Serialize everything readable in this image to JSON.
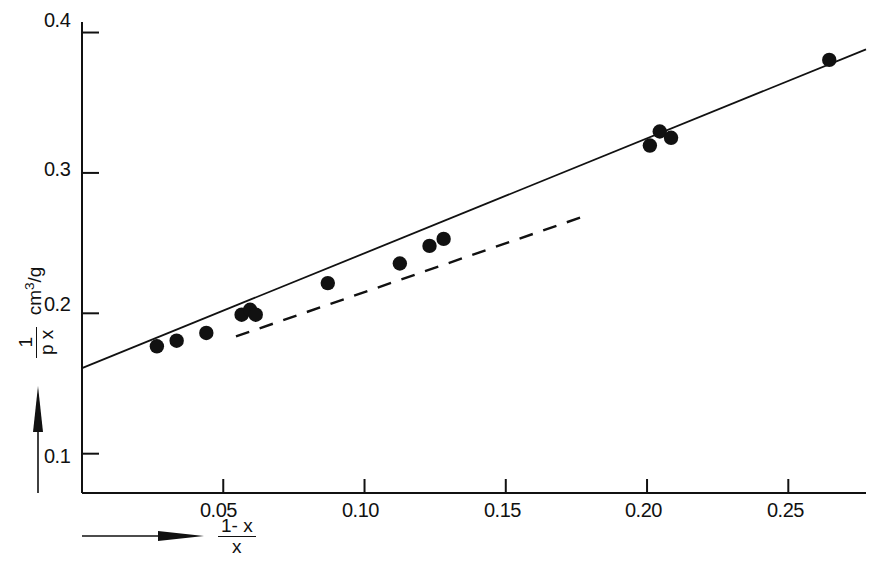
{
  "chart_data": {
    "type": "scatter",
    "title": "",
    "xlabel": "(1-x)/x",
    "ylabel": "1/(p x)  cm3/g",
    "xlim": [
      0.0,
      0.2775
    ],
    "ylim": [
      0.072,
      0.4075
    ],
    "grid": false,
    "legend": "none",
    "xticks": [
      0.05,
      0.1,
      0.15,
      0.2,
      0.25
    ],
    "xtick_labels": [
      "0.05",
      "0.10",
      "0.15",
      "0.20",
      "0.25"
    ],
    "yticks": [
      0.1,
      0.2,
      0.3,
      0.4
    ],
    "ytick_labels": [
      "0.1",
      "0.2",
      "0.3",
      "0.4"
    ],
    "points": [
      {
        "x": 0.0265,
        "y": 0.1765
      },
      {
        "x": 0.0335,
        "y": 0.1805
      },
      {
        "x": 0.044,
        "y": 0.186
      },
      {
        "x": 0.0565,
        "y": 0.199
      },
      {
        "x": 0.0595,
        "y": 0.2025
      },
      {
        "x": 0.0615,
        "y": 0.199
      },
      {
        "x": 0.087,
        "y": 0.2215
      },
      {
        "x": 0.1125,
        "y": 0.2355
      },
      {
        "x": 0.123,
        "y": 0.248
      },
      {
        "x": 0.128,
        "y": 0.253
      },
      {
        "x": 0.201,
        "y": 0.3195
      },
      {
        "x": 0.2045,
        "y": 0.3295
      },
      {
        "x": 0.2085,
        "y": 0.325
      },
      {
        "x": 0.2645,
        "y": 0.3805
      }
    ],
    "series": [
      {
        "name": "solid-fit-line",
        "style": "solid",
        "x": [
          0.0,
          0.2775
        ],
        "y": [
          0.161,
          0.388
        ]
      },
      {
        "name": "dashed-tangent-line",
        "style": "dashed",
        "x": [
          0.0545,
          0.179
        ],
        "y": [
          0.1835,
          0.27
        ]
      }
    ]
  },
  "axes": {
    "y_label_parts": {
      "numerator": "1",
      "denominator": "p x",
      "unit_prefix": "cm",
      "unit_sup": "3",
      "unit_suffix": "/g"
    },
    "x_label_parts": {
      "numerator": "1- x",
      "denominator": "x"
    }
  },
  "icons": {
    "y_axis_arrow": "up-arrow-icon",
    "x_axis_arrow": "right-arrow-icon"
  }
}
